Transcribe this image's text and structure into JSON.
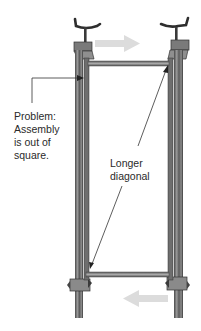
{
  "diagram": {
    "annotations": {
      "problem": {
        "lines": [
          "Problem:",
          "Assembly",
          "is out of",
          "square."
        ]
      },
      "diagonal": {
        "lines": [
          "Longer",
          "diagonal"
        ]
      }
    },
    "arrows": {
      "top": {
        "direction": "right",
        "color": "#d9d9d9"
      },
      "bottom": {
        "direction": "left",
        "color": "#d9d9d9"
      }
    },
    "colors": {
      "metal": "#6b6b6b",
      "metal_dark": "#3a3a3a",
      "wood": "#8a8a8a",
      "line": "#333333",
      "background": "#ffffff"
    }
  }
}
